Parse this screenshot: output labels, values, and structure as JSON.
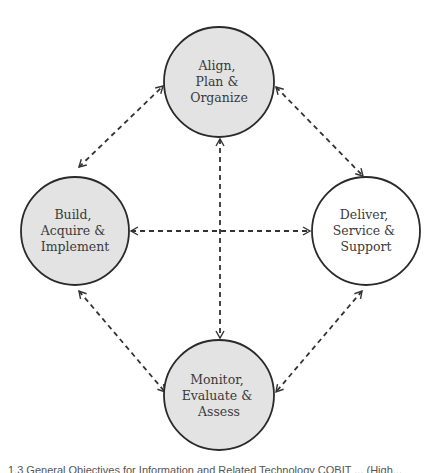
{
  "diagram": {
    "nodes": [
      {
        "id": "apo",
        "lines": [
          "Align,",
          "Plan &",
          "Organize"
        ],
        "cx": 219,
        "cy": 82,
        "r": 55,
        "fill": "#e3e3e3"
      },
      {
        "id": "bai",
        "lines": [
          "Build,",
          "Acquire &",
          "Implement"
        ],
        "cx": 75,
        "cy": 231,
        "r": 54,
        "fill": "#e3e3e3"
      },
      {
        "id": "dss",
        "lines": [
          "Deliver,",
          "Service &",
          "Support"
        ],
        "cx": 366,
        "cy": 231,
        "r": 54,
        "fill": "#ffffff"
      },
      {
        "id": "mea",
        "lines": [
          "Monitor,",
          "Evaluate &",
          "Assess"
        ],
        "cx": 219,
        "cy": 395,
        "r": 55,
        "fill": "#e3e3e3"
      }
    ],
    "edges": [
      {
        "from": "bai",
        "to": "apo",
        "style": "dashed",
        "bidirectional": true
      },
      {
        "from": "apo",
        "to": "dss",
        "style": "dashed",
        "bidirectional": true
      },
      {
        "from": "bai",
        "to": "mea",
        "style": "dashed",
        "bidirectional": true
      },
      {
        "from": "dss",
        "to": "mea",
        "style": "dashed",
        "bidirectional": true
      },
      {
        "from": "bai",
        "to": "dss",
        "style": "dashed",
        "bidirectional": true
      },
      {
        "from": "apo",
        "to": "mea",
        "style": "dashed",
        "bidirectional": true
      }
    ],
    "colors": {
      "stroke": "#2a2a2a",
      "filled": "#e3e3e3",
      "unfilled": "#ffffff",
      "arrow": "#333333"
    }
  },
  "caption": "1.3 General Objectives for Information and Related Technology COBIT ... (High..."
}
